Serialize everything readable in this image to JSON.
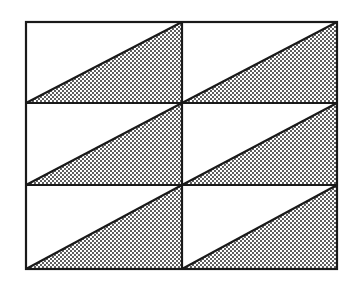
{
  "diagram": {
    "frame": {
      "x": 26,
      "y": 22,
      "width": 311,
      "height": 247
    },
    "columns": 2,
    "rows": 3,
    "column_dividers_x": [
      182
    ],
    "row_dividers_y": [
      103,
      185
    ],
    "shaded_region": "lower-right triangle of each cell",
    "colors": {
      "background": "#ffffff",
      "line": "#1a1a1a",
      "stipple": "#1a1a1a"
    },
    "line_width": 2.2,
    "stipple_spacing": 4
  }
}
